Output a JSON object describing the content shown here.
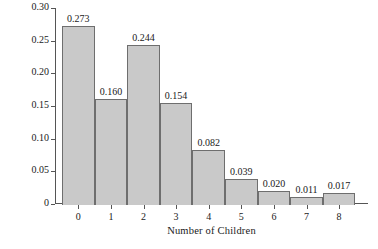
{
  "chart_data": {
    "type": "bar",
    "title": "",
    "xlabel": "Number of Children",
    "ylabel": "Probability",
    "categories": [
      "0",
      "1",
      "2",
      "3",
      "4",
      "5",
      "6",
      "7",
      "8"
    ],
    "values": [
      0.273,
      0.16,
      0.244,
      0.154,
      0.082,
      0.039,
      0.02,
      0.011,
      0.017
    ],
    "value_labels": [
      "0.273",
      "0.160",
      "0.244",
      "0.154",
      "0.082",
      "0.039",
      "0.020",
      "0.011",
      "0.017"
    ],
    "ylim": [
      0,
      0.3
    ],
    "yticks": [
      0,
      0.05,
      0.1,
      0.15,
      0.2,
      0.25,
      0.3
    ],
    "ytick_labels": [
      "0",
      "0.05",
      "0.10",
      "0.15",
      "0.20",
      "0.25",
      "0.30"
    ],
    "grid": false,
    "legend": null,
    "bar_fill_color": "#c9c9c9",
    "bar_edge_color": "#6e6e6e",
    "axis_color": "#555555",
    "text_color": "#1a1a1a"
  }
}
